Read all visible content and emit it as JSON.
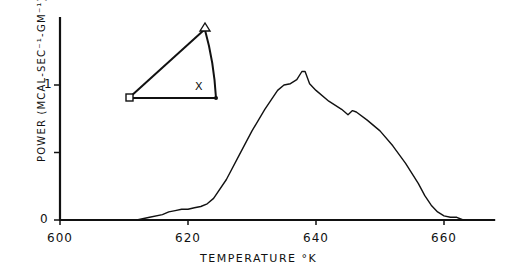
{
  "chart_data": {
    "type": "line",
    "title": "",
    "xlabel": "TEMPERATURE °K",
    "ylabel": "POWER (MCAL-SEC⁻¹-GM⁻¹)",
    "xlim": [
      600,
      668
    ],
    "ylim": [
      0,
      1.5
    ],
    "x_ticks": [
      "600",
      "620",
      "640",
      "660"
    ],
    "y_ticks": [
      "0",
      "1"
    ],
    "y_minor_ticks": [
      0.5
    ],
    "grid": false,
    "legend": null,
    "series": [
      {
        "name": "power",
        "x": [
          612,
          614,
          616,
          617,
          618,
          619,
          620,
          621,
          622,
          623,
          624,
          626,
          628,
          630,
          632,
          634,
          635,
          636,
          637,
          637.8,
          638.3,
          639,
          640,
          642,
          644,
          645,
          645.7,
          646.3,
          648,
          650,
          652,
          654,
          656,
          657,
          658,
          659,
          660,
          661,
          662,
          663
        ],
        "y": [
          0.0,
          0.02,
          0.04,
          0.06,
          0.07,
          0.08,
          0.08,
          0.09,
          0.1,
          0.12,
          0.16,
          0.3,
          0.48,
          0.66,
          0.82,
          0.96,
          1.0,
          1.01,
          1.04,
          1.1,
          1.1,
          1.01,
          0.96,
          0.88,
          0.82,
          0.78,
          0.81,
          0.8,
          0.74,
          0.66,
          0.55,
          0.42,
          0.27,
          0.18,
          0.11,
          0.06,
          0.03,
          0.02,
          0.02,
          0.0
        ]
      }
    ],
    "annotations": [
      {
        "type": "inset-triangle-symbol",
        "text": "X",
        "description": "sector/triangle diagram with square vertex at left, triangle marker at top, dot at lower right"
      }
    ]
  },
  "labels": {
    "x_axis": "TEMPERATURE °K",
    "y_axis": "POWER (MCAL-SEC⁻¹-GM⁻¹)",
    "inset_mark": "X",
    "x_ticks": [
      "600",
      "620",
      "640",
      "660"
    ],
    "y_tick_0": "0",
    "y_tick_1": "1"
  }
}
